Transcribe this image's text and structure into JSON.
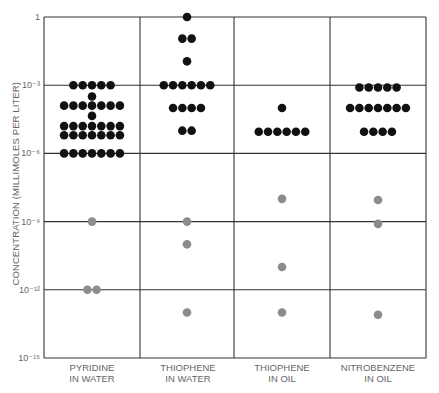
{
  "chart_data": {
    "type": "scatter",
    "subtype": "dot-strip plot (log scale)",
    "title": "",
    "xlabel": "",
    "ylabel": "CONCENTRATION (MILLIMOLES PER LITER)",
    "yscale": "log10",
    "ylim": [
      1e-15,
      1
    ],
    "y_ticks": [
      {
        "label": "1",
        "exp": 0
      },
      {
        "label": "10⁻³",
        "exp": -3
      },
      {
        "label": "10⁻⁶",
        "exp": -6
      },
      {
        "label": "10⁻⁹",
        "exp": -9
      },
      {
        "label": "10⁻¹²",
        "exp": -12
      },
      {
        "label": "10⁻¹⁵",
        "exp": -15
      }
    ],
    "grid": true,
    "categories": [
      {
        "line1": "PYRIDINE",
        "line2": "IN WATER"
      },
      {
        "line1": "THIOPHENE",
        "line2": "IN WATER"
      },
      {
        "line1": "THIOPHENE",
        "line2": "IN OIL"
      },
      {
        "line1": "NITROBENZENE",
        "line2": "IN OIL"
      }
    ],
    "series": [
      {
        "name": "black dots (upper group)",
        "color": "#111111",
        "rows": [
          [
            {
              "exp": -3.0,
              "count": 5
            },
            {
              "exp": -3.5,
              "count": 1
            },
            {
              "exp": -3.9,
              "count": 7
            },
            {
              "exp": -4.35,
              "count": 1
            },
            {
              "exp": -4.8,
              "count": 7
            },
            {
              "exp": -5.2,
              "count": 7
            },
            {
              "exp": -6.0,
              "count": 7
            }
          ],
          [
            {
              "exp": 0.0,
              "count": 1
            },
            {
              "exp": -0.95,
              "count": 2
            },
            {
              "exp": -1.95,
              "count": 1
            },
            {
              "exp": -3.0,
              "count": 6
            },
            {
              "exp": -4.0,
              "count": 4
            },
            {
              "exp": -5.0,
              "count": 2
            }
          ],
          [
            {
              "exp": -4.0,
              "count": 1
            },
            {
              "exp": -5.05,
              "count": 6
            }
          ],
          [
            {
              "exp": -3.1,
              "count": 5
            },
            {
              "exp": -4.0,
              "count": 7
            },
            {
              "exp": -5.05,
              "count": 4
            }
          ]
        ]
      },
      {
        "name": "gray dots (lower group)",
        "color": "#8c8c8c",
        "rows": [
          [
            {
              "exp": -9.0,
              "count": 1
            },
            {
              "exp": -12.0,
              "count": 2
            }
          ],
          [
            {
              "exp": -9.0,
              "count": 1
            },
            {
              "exp": -10.0,
              "count": 1
            },
            {
              "exp": -13.0,
              "count": 1
            }
          ],
          [
            {
              "exp": -8.0,
              "count": 1
            },
            {
              "exp": -11.0,
              "count": 1
            },
            {
              "exp": -13.0,
              "count": 1
            }
          ],
          [
            {
              "exp": -8.05,
              "count": 1
            },
            {
              "exp": -9.1,
              "count": 1
            },
            {
              "exp": -13.1,
              "count": 1
            }
          ]
        ]
      }
    ]
  },
  "colors": {
    "grid": "#333333",
    "black_dot": "#111111",
    "gray_dot": "#8c8c8c",
    "text": "#666666"
  }
}
